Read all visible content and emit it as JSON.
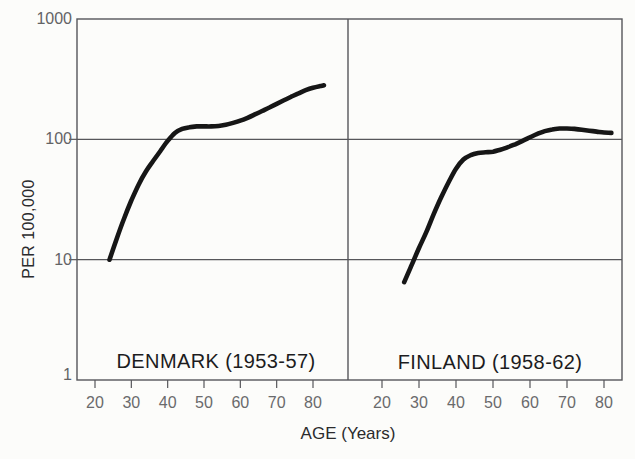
{
  "figure": {
    "background": "#fcfcfa",
    "frame_color": "#56565a",
    "curve_color": "#161616",
    "tick_label_color": "#636365",
    "title_color": "#1c1c1e"
  },
  "labels": {
    "y_axis": "PER 100,000",
    "x_axis": "AGE (Years)"
  },
  "chart_data": [
    {
      "type": "line",
      "title": "DENMARK (1953-57)",
      "xlabel": "AGE (Years)",
      "ylabel": "PER 100,000",
      "yscale": "log",
      "xlim": [
        14,
        86
      ],
      "ylim": [
        1,
        1000
      ],
      "xticks": [
        20,
        30,
        40,
        50,
        60,
        70,
        80
      ],
      "yticks": [
        1,
        10,
        100,
        1000
      ],
      "grid_y_values": [
        10,
        100
      ],
      "legend": "none",
      "series": [
        {
          "name": "DENMARK (1953-57)",
          "x": [
            24,
            26,
            28,
            30,
            32,
            34,
            36,
            38,
            40,
            42,
            44,
            46,
            48,
            50,
            52,
            54,
            56,
            58,
            60,
            62,
            64,
            66,
            68,
            70,
            72,
            74,
            76,
            78,
            80,
            82,
            83
          ],
          "y": [
            10,
            15,
            22,
            31,
            42,
            54,
            66,
            80,
            97,
            113,
            122,
            126,
            128,
            128,
            128,
            129,
            132,
            137,
            143,
            151,
            161,
            172,
            184,
            197,
            211,
            226,
            241,
            256,
            268,
            277,
            281
          ]
        }
      ]
    },
    {
      "type": "line",
      "title": "FINLAND (1958-62)",
      "xlabel": "AGE (Years)",
      "ylabel": "PER 100,000",
      "yscale": "log",
      "xlim": [
        14,
        86
      ],
      "ylim": [
        1,
        1000
      ],
      "xticks": [
        20,
        30,
        40,
        50,
        60,
        70,
        80
      ],
      "yticks": [
        1,
        10,
        100,
        1000
      ],
      "grid_y_values": [
        10,
        100
      ],
      "legend": "none",
      "series": [
        {
          "name": "FINLAND (1958-62)",
          "x": [
            26,
            28,
            30,
            32,
            34,
            36,
            38,
            40,
            42,
            44,
            46,
            48,
            50,
            52,
            54,
            56,
            58,
            60,
            62,
            64,
            66,
            68,
            70,
            72,
            74,
            76,
            78,
            80,
            82
          ],
          "y": [
            6.5,
            9,
            12.5,
            17,
            24,
            33,
            44,
            57,
            68,
            74,
            77,
            78,
            79,
            82,
            86,
            91,
            97,
            104,
            111,
            117,
            121,
            123,
            123,
            122,
            120,
            118,
            116,
            114,
            113
          ]
        }
      ]
    }
  ]
}
